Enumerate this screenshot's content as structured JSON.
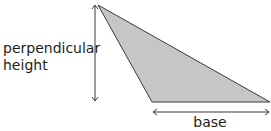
{
  "diagram": {
    "labels": {
      "height_line1": "perpendicular",
      "height_line2": "height",
      "base": "base"
    },
    "shape": {
      "type": "triangle",
      "vertices": [
        [
          98,
          5
        ],
        [
          152,
          102
        ],
        [
          270,
          102
        ]
      ],
      "fill": "#c6c6c6",
      "stroke": "#3a3a3a"
    },
    "arrows": {
      "height": {
        "x": 95,
        "y1": 5,
        "y2": 101
      },
      "base": {
        "y": 112,
        "x1": 152,
        "x2": 270
      }
    },
    "colors": {
      "text": "#231f20",
      "line": "#3a3a3a",
      "fill": "#c6c6c6"
    }
  }
}
